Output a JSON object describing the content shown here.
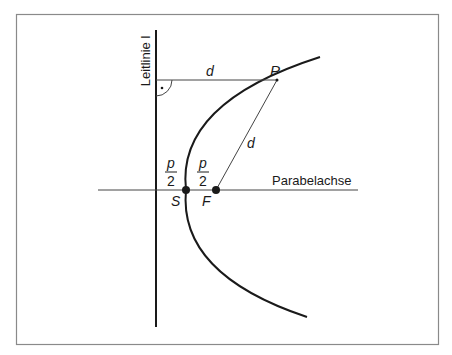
{
  "diagram": {
    "type": "parabola-definition",
    "labels": {
      "directrix": "Leitlinie l",
      "axis": "Parabelachse",
      "point": "P",
      "vertex": "S",
      "focus": "F",
      "distance_horizontal": "d",
      "distance_focal": "d",
      "half_p_left_num": "p",
      "half_p_left_den": "2",
      "half_p_right_num": "p",
      "half_p_right_den": "2"
    },
    "colors": {
      "ink": "#1a1a1a",
      "frame": "#8a8a8a",
      "background": "#ffffff"
    }
  }
}
